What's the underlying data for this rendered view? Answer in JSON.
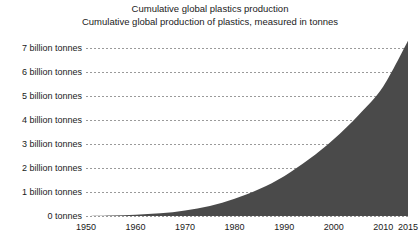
{
  "title": {
    "line1": "Cumulative global plastics production",
    "line2": "Cumulative global production of plastics, measured in tonnes"
  },
  "chart_data": {
    "type": "area",
    "title": "Cumulative global plastics production",
    "subtitle": "Cumulative global production of plastics, measured in tonnes",
    "xlabel": "",
    "ylabel": "",
    "xlim": [
      1950,
      2015
    ],
    "ylim": [
      0,
      7.5
    ],
    "grid": true,
    "legend": false,
    "fill_color": "#4a4a4a",
    "gridline_color": "#9a9a9a",
    "background_color": "#ffffff",
    "y_ticks": [
      0,
      1,
      2,
      3,
      4,
      5,
      6,
      7
    ],
    "y_tick_labels": [
      "0 tonnes",
      "1 billion tonnes",
      "2 billion tonnes",
      "3 billion tonnes",
      "4 billion tonnes",
      "5 billion tonnes",
      "6 billion tonnes",
      "7 billion tonnes"
    ],
    "x_ticks": [
      1950,
      1960,
      1970,
      1980,
      1990,
      2000,
      2010,
      2015
    ],
    "x_tick_labels": [
      "1950",
      "1960",
      "1970",
      "1980",
      "1990",
      "2000",
      "2010",
      "2015"
    ],
    "units": "billion tonnes",
    "x": [
      1950,
      1955,
      1960,
      1965,
      1970,
      1975,
      1980,
      1985,
      1990,
      1995,
      2000,
      2005,
      2010,
      2015
    ],
    "values": [
      0.0,
      0.02,
      0.05,
      0.11,
      0.23,
      0.42,
      0.72,
      1.12,
      1.66,
      2.36,
      3.2,
      4.2,
      5.4,
      7.3
    ]
  }
}
